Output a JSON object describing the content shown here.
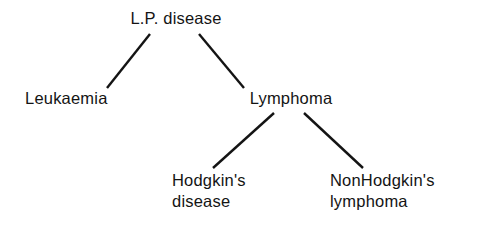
{
  "figure": {
    "kind": "hierarchy-tree",
    "background_color": "#ffffff",
    "line_color": "#141414",
    "text_color": "#141414"
  },
  "nodes": {
    "root": {
      "id": "lp-disease",
      "label": "L.P. disease",
      "level": 0
    },
    "leukaemia": {
      "id": "leukaemia",
      "label": "Leukaemia",
      "level": 1
    },
    "lymphoma": {
      "id": "lymphoma",
      "label": "Lymphoma",
      "level": 1
    },
    "hodgkins": {
      "id": "hodgkins-disease",
      "label": "Hodgkin's\ndisease",
      "level": 2
    },
    "nonhodgkins": {
      "id": "nonhodgkins-lymphoma",
      "label": "NonHodgkin's\nlymphoma",
      "level": 2
    }
  },
  "edges": [
    {
      "id": "edge-root-leukaemia",
      "from": "L.P. disease",
      "to": "Leukaemia"
    },
    {
      "id": "edge-root-lymphoma",
      "from": "L.P. disease",
      "to": "Lymphoma"
    },
    {
      "id": "edge-lymphoma-hodgkins",
      "from": "Lymphoma",
      "to": "Hodgkin's disease"
    },
    {
      "id": "edge-lymphoma-nonhodgkins",
      "from": "Lymphoma",
      "to": "NonHodgkin's lymphoma"
    }
  ]
}
